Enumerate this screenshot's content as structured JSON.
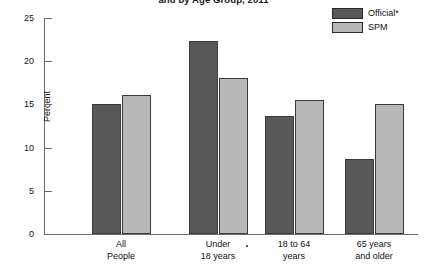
{
  "chart_data": {
    "type": "bar",
    "title": "and by Age Group, 2011",
    "xlabel": "",
    "ylabel": "Percent",
    "ylim": [
      0,
      25
    ],
    "yticks": [
      0,
      5,
      10,
      15,
      20,
      25
    ],
    "ytick_labels": [
      "0",
      "5",
      "10",
      "15",
      "20",
      "25"
    ],
    "grid": false,
    "legend_position": "top-right",
    "categories": [
      "All People",
      "Under 18 years",
      "18 to 64 years",
      "65 years and older"
    ],
    "category_lines": [
      [
        "All",
        "People"
      ],
      [
        "Under",
        "18 years"
      ],
      [
        "18 to 64",
        "years"
      ],
      [
        "65 years",
        "and older"
      ]
    ],
    "series": [
      {
        "name": "Official*",
        "color": "#585858",
        "values": [
          15.1,
          22.3,
          13.7,
          8.7
        ]
      },
      {
        "name": "SPM",
        "color": "#b8b8b8",
        "values": [
          16.1,
          18.1,
          15.5,
          15.1
        ]
      }
    ]
  },
  "legend": {
    "items": [
      {
        "label": "Official*",
        "color": "#585858"
      },
      {
        "label": "SPM",
        "color": "#b8b8b8"
      }
    ]
  },
  "colors": {
    "official": "#585858",
    "spm": "#b8b8b8",
    "axis": "#6d6d6d",
    "text": "#111111",
    "background": "#ffffff"
  }
}
